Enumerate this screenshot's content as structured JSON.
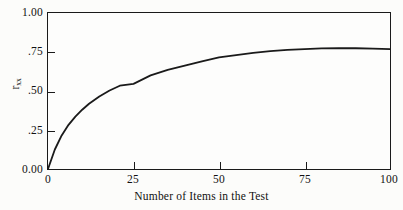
{
  "figure": {
    "background_color": "#fcfcfa",
    "ink_color": "#1a1a1a"
  },
  "axes": {
    "y_title_symbol": "r",
    "y_title_subscript": "xx",
    "x_title": "Number of Items in the Test",
    "y_ticks": [
      {
        "value": 1.0,
        "label": "1.00"
      },
      {
        "value": 0.75,
        "label": ".75"
      },
      {
        "value": 0.5,
        "label": ".50"
      },
      {
        "value": 0.25,
        "label": ".25"
      },
      {
        "value": 0.0,
        "label": "0.00"
      }
    ],
    "x_ticks": [
      {
        "value": 0,
        "label": "0"
      },
      {
        "value": 25,
        "label": "25"
      },
      {
        "value": 50,
        "label": "50"
      },
      {
        "value": 75,
        "label": "75"
      },
      {
        "value": 100,
        "label": "100"
      }
    ]
  },
  "chart_data": {
    "type": "line",
    "title": "",
    "subtitle": "",
    "xlabel": "Number of Items in the Test",
    "ylabel": "r_xx",
    "xlim": [
      0,
      100
    ],
    "ylim": [
      0.0,
      1.0
    ],
    "grid": false,
    "legend": null,
    "line_color": "#1a1a1a",
    "line_width": 1.8,
    "series": [
      {
        "name": "Reliability as a function of test length",
        "x": [
          0,
          2,
          4,
          6,
          8,
          10,
          12,
          15,
          18,
          21,
          25,
          30,
          35,
          40,
          45,
          50,
          55,
          60,
          65,
          70,
          75,
          80,
          85,
          90,
          95,
          100
        ],
        "y": [
          0.0,
          0.125,
          0.215,
          0.283,
          0.336,
          0.38,
          0.418,
          0.465,
          0.503,
          0.534,
          0.546,
          0.6,
          0.635,
          0.663,
          0.69,
          0.715,
          0.73,
          0.744,
          0.755,
          0.763,
          0.769,
          0.773,
          0.775,
          0.774,
          0.772,
          0.768
        ]
      }
    ],
    "annotations": []
  }
}
